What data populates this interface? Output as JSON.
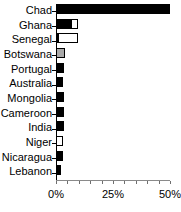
{
  "chart_data": {
    "type": "bar",
    "orientation": "horizontal",
    "title": "",
    "xlabel": "",
    "ylabel": "",
    "xlim": [
      0,
      50
    ],
    "xtick_labels": [
      "0%",
      "25%",
      "50%"
    ],
    "xtick_values": [
      0,
      25,
      50
    ],
    "grid": false,
    "legend": "none",
    "categories": [
      "Chad",
      "Ghana",
      "Senegal",
      "Botswana",
      "Portugal",
      "Australia",
      "Mongolia",
      "Cameroon",
      "India",
      "Niger",
      "Nicaragua",
      "Lebanon"
    ],
    "values": [
      50.0,
      9.5,
      9.5,
      4.0,
      3.5,
      3.0,
      3.5,
      3.5,
      3.5,
      3.0,
      3.0,
      2.0
    ],
    "series": [
      {
        "name": "black",
        "values": [
          50.0,
          6.5,
          1.0,
          0,
          3.5,
          3.0,
          3.5,
          3.5,
          3.5,
          0,
          3.0,
          2.0
        ]
      },
      {
        "name": "white",
        "values": [
          0,
          3.0,
          8.5,
          0,
          0,
          0,
          0,
          0,
          0,
          3.0,
          0,
          0
        ]
      },
      {
        "name": "gray",
        "values": [
          0,
          0,
          0,
          4.0,
          0,
          0,
          0,
          0,
          0,
          0,
          0,
          0
        ]
      }
    ],
    "bars": [
      {
        "label": "Chad",
        "total": 50.0,
        "segments": [
          {
            "style": "black",
            "start": 0.0,
            "length": 50.0
          }
        ]
      },
      {
        "label": "Ghana",
        "total": 9.5,
        "segments": [
          {
            "style": "black",
            "start": 0.0,
            "length": 6.5
          },
          {
            "style": "white",
            "start": 6.5,
            "length": 3.0
          }
        ]
      },
      {
        "label": "Senegal",
        "total": 9.5,
        "segments": [
          {
            "style": "black",
            "start": 0.0,
            "length": 1.0
          },
          {
            "style": "white",
            "start": 1.0,
            "length": 8.5
          }
        ]
      },
      {
        "label": "Botswana",
        "total": 4.0,
        "segments": [
          {
            "style": "gray",
            "start": 0.0,
            "length": 4.0
          }
        ]
      },
      {
        "label": "Portugal",
        "total": 3.5,
        "segments": [
          {
            "style": "black",
            "start": 0.0,
            "length": 3.5
          }
        ]
      },
      {
        "label": "Australia",
        "total": 3.0,
        "segments": [
          {
            "style": "black",
            "start": 0.0,
            "length": 3.0
          }
        ]
      },
      {
        "label": "Mongolia",
        "total": 3.5,
        "segments": [
          {
            "style": "black",
            "start": 0.0,
            "length": 3.5
          }
        ]
      },
      {
        "label": "Cameroon",
        "total": 3.5,
        "segments": [
          {
            "style": "black",
            "start": 0.0,
            "length": 3.5
          }
        ]
      },
      {
        "label": "India",
        "total": 3.5,
        "segments": [
          {
            "style": "black",
            "start": 0.0,
            "length": 3.5
          }
        ]
      },
      {
        "label": "Niger",
        "total": 3.0,
        "segments": [
          {
            "style": "white",
            "start": 0.0,
            "length": 3.0
          }
        ]
      },
      {
        "label": "Nicaragua",
        "total": 3.0,
        "segments": [
          {
            "style": "black",
            "start": 0.0,
            "length": 3.0
          }
        ]
      },
      {
        "label": "Lebanon",
        "total": 2.0,
        "segments": [
          {
            "style": "black",
            "start": 0.0,
            "length": 2.0
          }
        ]
      }
    ],
    "colors": {
      "black": "#000000",
      "white": "#ffffff",
      "gray": "#a9a9a9",
      "axis": "#000000",
      "baseline": "#8a8a8a",
      "text": "#000000",
      "background": "#ffffff"
    }
  }
}
